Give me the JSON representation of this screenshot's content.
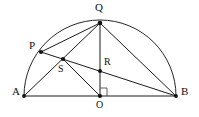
{
  "figure": {
    "background_color": "#ffffff",
    "stroke_color": "#1b1b1b",
    "label_color": "#101010",
    "width": 199,
    "height": 117,
    "points": {
      "A": {
        "label": "A",
        "x": 24,
        "y": 96,
        "label_x": 12,
        "label_y": 88
      },
      "B": {
        "label": "B",
        "x": 176,
        "y": 96,
        "label_x": 181,
        "label_y": 88
      },
      "O": {
        "label": "O",
        "x": 100,
        "y": 96,
        "label_x": 96,
        "label_y": 100
      },
      "Q": {
        "label": "Q",
        "x": 100,
        "y": 23,
        "label_x": 96,
        "label_y": 3
      },
      "P": {
        "label": "P",
        "x": 41,
        "y": 52,
        "label_x": 28,
        "label_y": 41
      },
      "R": {
        "label": "R",
        "x": 100,
        "y": 71,
        "label_x": 104,
        "label_y": 56
      },
      "S": {
        "label": "S",
        "x": 63,
        "y": 59,
        "label_x": 59,
        "label_y": 63
      }
    },
    "circle": {
      "center_x": 100,
      "center_y": 96,
      "radius": 76,
      "arc_path": "M 24 96 A 76 76 0 0 1 176 96"
    },
    "segments": [
      {
        "name": "diameter-AB",
        "from": "A",
        "to": "B",
        "d": "M 24 96 L 176 96"
      },
      {
        "name": "altitude-QO",
        "from": "Q",
        "to": "O",
        "d": "M 100 23 L 100 96"
      },
      {
        "name": "chord-QA",
        "from": "Q",
        "to": "A",
        "d": "M 100 23 L 24 96"
      },
      {
        "name": "chord-QB",
        "from": "Q",
        "to": "B",
        "d": "M 100 23 L 176 96"
      },
      {
        "name": "chord-QP",
        "from": "Q",
        "to": "P",
        "d": "M 100 23 L 41 52"
      },
      {
        "name": "chord-PB",
        "from": "P",
        "to": "B",
        "d": "M 41 52 L 176 96"
      },
      {
        "name": "segment-SO",
        "from": "S",
        "to": "O",
        "d": "M 63 59 L 100 96"
      }
    ],
    "right_angle": {
      "name": "right-angle-at-O",
      "vertex": "O",
      "d": "M 100 88 L 107 88 L 107 96",
      "size": 7
    },
    "dots": [
      "A",
      "B",
      "O",
      "Q",
      "P",
      "R",
      "S"
    ]
  }
}
